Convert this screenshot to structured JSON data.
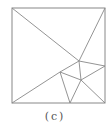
{
  "figure": {
    "caption": "(c)",
    "stroke_color": "#888888",
    "square": {
      "x1": 12,
      "y1": 8,
      "x2": 105,
      "y2": 103
    },
    "points": {
      "TL": [
        12,
        8
      ],
      "TR": [
        105,
        8
      ],
      "BL": [
        12,
        103
      ],
      "BR": [
        105,
        103
      ],
      "A": [
        79,
        61
      ],
      "B": [
        81,
        80
      ],
      "C": [
        60,
        72
      ],
      "D": [
        105,
        66
      ],
      "E": [
        70,
        103
      ]
    },
    "segments": [
      [
        "TL",
        "A"
      ],
      [
        "TR",
        "A"
      ],
      [
        "BL",
        "C"
      ],
      [
        "C",
        "A"
      ],
      [
        "A",
        "D"
      ],
      [
        "A",
        "B"
      ],
      [
        "C",
        "B"
      ],
      [
        "B",
        "D"
      ],
      [
        "B",
        "BR"
      ],
      [
        "C",
        "E"
      ],
      [
        "B",
        "E"
      ]
    ]
  }
}
